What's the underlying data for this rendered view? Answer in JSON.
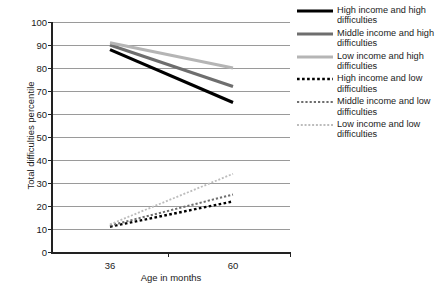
{
  "chart_data": {
    "type": "line",
    "title": "",
    "xlabel": "Age in months",
    "ylabel": "Total difficulties percentile",
    "x": [
      36,
      60
    ],
    "xtick_labels": [
      "36",
      "60"
    ],
    "ytick_labels": [
      "0",
      "10",
      "20",
      "30",
      "40",
      "50",
      "60",
      "70",
      "80",
      "90",
      "100"
    ],
    "ylim": [
      0,
      100
    ],
    "ytick_step": 10,
    "grid": true,
    "legend_position": "right",
    "series": [
      {
        "name": "High income and high difficulties",
        "values": [
          88,
          65
        ],
        "color": "#000000",
        "style": "solid",
        "width": 3.2
      },
      {
        "name": "Middle income and high difficulties",
        "values": [
          90,
          72
        ],
        "color": "#6e6e6e",
        "style": "solid",
        "width": 3.2
      },
      {
        "name": "Low income and high difficulties",
        "values": [
          91,
          80
        ],
        "color": "#b5b5b5",
        "style": "solid",
        "width": 3.0
      },
      {
        "name": "High income and low difficulties",
        "values": [
          11,
          22
        ],
        "color": "#000000",
        "style": "dashed",
        "width": 2.4
      },
      {
        "name": "Middle income and low difficulties",
        "values": [
          11.5,
          25
        ],
        "color": "#6e6e6e",
        "style": "dashed",
        "width": 2.0
      },
      {
        "name": "Low income and low difficulties",
        "values": [
          12,
          34
        ],
        "color": "#bcbcbc",
        "style": "dashed",
        "width": 1.8
      }
    ]
  },
  "legend": {
    "items": [
      {
        "label": "High income and high difficulties"
      },
      {
        "label": "Middle income and high difficulties"
      },
      {
        "label": "Low income and high difficulties"
      },
      {
        "label": "High income and low difficulties"
      },
      {
        "label": "Middle income and low difficulties"
      },
      {
        "label": "Low income and low difficulties"
      }
    ]
  }
}
